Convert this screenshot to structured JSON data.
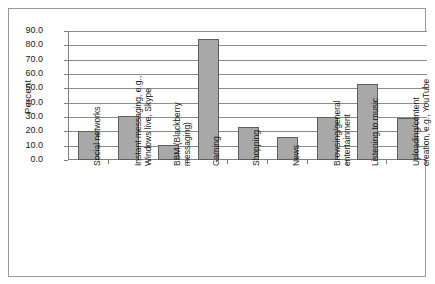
{
  "chart_data": {
    "type": "bar",
    "title": "",
    "xlabel": "",
    "ylabel": "Percent",
    "ylim": [
      0,
      90
    ],
    "ytick_step": 10,
    "grid": true,
    "legend": "none",
    "bar_color": "#a8a8a8",
    "bar_edge_color": "#5e5e5e",
    "ytick_labels": [
      "90.0",
      "80.0",
      "70.0",
      "60.0",
      "50.0",
      "40.0",
      "30.0",
      "20.0",
      "10.0",
      "0.0"
    ],
    "categories": [
      "Social networks",
      "Instant messaging, e.g.,\nWindows live, Skype",
      "BBM (Blackberry\nmessaging)",
      "Gaming",
      "Shopping",
      "News",
      "Browsing/general\nentertainment",
      "Listening to music",
      "Uploading/content\ncreation, e.g., YouTube"
    ],
    "values": [
      20.5,
      30.5,
      10.5,
      84.5,
      23.0,
      16.0,
      30.0,
      53.0,
      29.5
    ]
  }
}
